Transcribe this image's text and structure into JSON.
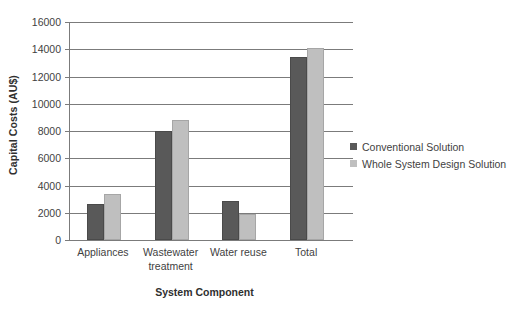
{
  "chart_data": {
    "type": "bar",
    "title": "",
    "subtitle": "",
    "xlabel": "System Component",
    "ylabel": "Capital Costs (AU$)",
    "categories": [
      "Appliances",
      "Wastewater treatment",
      "Water reuse",
      "Total"
    ],
    "series": [
      {
        "name": "Conventional Solution",
        "color": "#595959",
        "values": [
          2650,
          8000,
          2850,
          13450
        ]
      },
      {
        "name": "Whole System Design Solution",
        "color": "#bfbfbf",
        "values": [
          3400,
          8800,
          1900,
          14100
        ]
      }
    ],
    "ylim": [
      0,
      16000
    ],
    "ytick_labels": [
      "0",
      "2000",
      "4000",
      "6000",
      "8000",
      "10000",
      "12000",
      "14000",
      "16000"
    ],
    "ytick_values": [
      0,
      2000,
      4000,
      6000,
      8000,
      10000,
      12000,
      14000,
      16000
    ],
    "grid": true,
    "grid_axis": "y",
    "legend_position": "right",
    "axis_color": "#7b7b7b",
    "background_color": "#ffffff",
    "text_color": "#3f3f3f"
  },
  "legend": {
    "entries": [
      {
        "label": "Conventional Solution"
      },
      {
        "label": "Whole System Design Solution"
      }
    ]
  }
}
